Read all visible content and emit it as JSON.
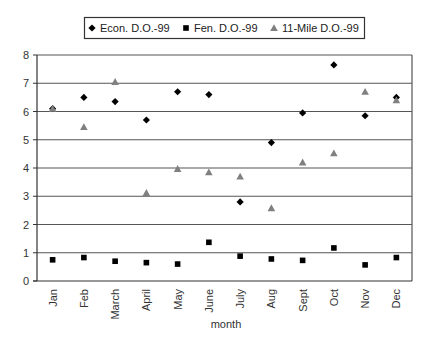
{
  "chart_data": {
    "type": "scatter",
    "title": "",
    "xlabel": "month",
    "ylabel": "",
    "ylim": [
      0,
      8
    ],
    "yticks": [
      0,
      1,
      2,
      3,
      4,
      5,
      6,
      7,
      8
    ],
    "grid": true,
    "legend_position": "top",
    "categories": [
      "Jan",
      "Feb",
      "March",
      "April",
      "May",
      "June",
      "July",
      "Aug",
      "Sept",
      "Oct",
      "Nov",
      "Dec"
    ],
    "series": [
      {
        "name": "Econ. D.O.-99",
        "marker": "diamond",
        "color": "#000000",
        "values": [
          6.1,
          6.5,
          6.35,
          5.7,
          6.7,
          6.6,
          2.8,
          4.9,
          5.95,
          7.65,
          5.85,
          6.5
        ]
      },
      {
        "name": "Fen. D.O.-99",
        "marker": "square",
        "color": "#000000",
        "values": [
          0.75,
          0.83,
          0.7,
          0.65,
          0.6,
          1.37,
          0.88,
          0.78,
          0.73,
          1.17,
          0.57,
          0.83
        ]
      },
      {
        "name": "11-Mile D.O.-99",
        "marker": "triangle",
        "color": "#808080",
        "values": [
          6.1,
          5.45,
          7.05,
          3.12,
          3.97,
          3.85,
          3.7,
          2.58,
          4.2,
          4.52,
          6.7,
          6.4
        ]
      }
    ]
  }
}
